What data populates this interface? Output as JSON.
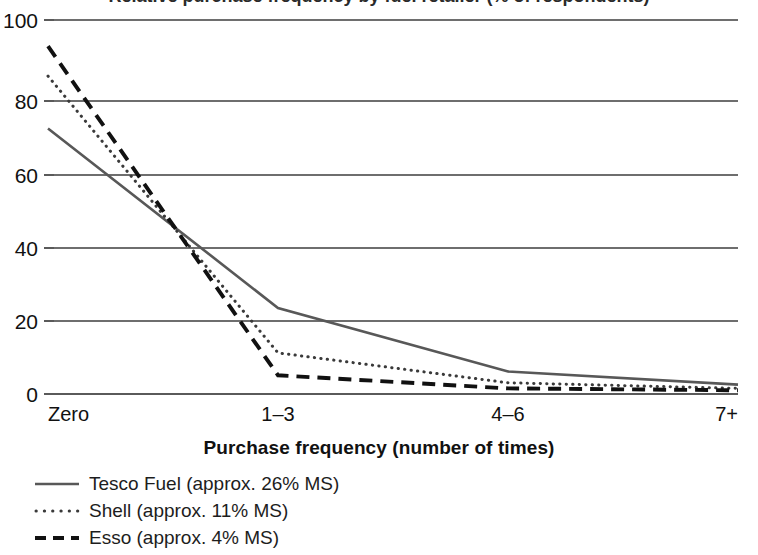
{
  "chart_data": {
    "type": "line",
    "title": "Relative purchase frequency by fuel retailer (% of respondents)",
    "xlabel": "Purchase frequency (number of times)",
    "ylabel": "",
    "categories": [
      "Zero",
      "1–3",
      "4–6",
      "7+"
    ],
    "xtick_labels": [
      "Zero",
      "1–3",
      "4–6",
      "7+"
    ],
    "ytick_labels": [
      "0",
      "20",
      "40",
      "60",
      "80",
      "100"
    ],
    "yticks": [
      0,
      20,
      40,
      60,
      80,
      100
    ],
    "ylim": [
      0,
      100
    ],
    "grid": true,
    "legend_position": "below-left",
    "series": [
      {
        "name": "Tesco Fuel (approx. 26% MS)",
        "style": "solid",
        "color": "#585858",
        "values": [
          71,
          23,
          6,
          2.5
        ]
      },
      {
        "name": "Shell (approx. 11% MS)",
        "style": "dotted",
        "color": "#3a3a3a",
        "values": [
          85,
          11,
          3,
          1.5
        ]
      },
      {
        "name": "Esso (approx. 4% MS)",
        "style": "dashed",
        "color": "#111111",
        "values": [
          93,
          5,
          1.5,
          1
        ]
      }
    ]
  },
  "axis": {
    "x_title": "Purchase frequency (number of times)"
  },
  "legend": {
    "items": [
      {
        "label": "Tesco Fuel (approx. 26% MS)",
        "style": "solid"
      },
      {
        "label": "Shell (approx. 11% MS)",
        "style": "dotted"
      },
      {
        "label": "Esso (approx. 4% MS)",
        "style": "dashed"
      }
    ]
  }
}
